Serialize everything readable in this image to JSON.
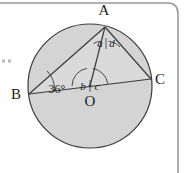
{
  "figure": {
    "colors": {
      "circle_fill": "#d4d4d4",
      "stroke": "#3a3a3a",
      "border": "#9a9a9a",
      "text": "#1a1a1a",
      "background": "#ffffff"
    },
    "circle": {
      "centre_label": "O",
      "cx": 90,
      "cy": 86,
      "r": 62
    },
    "vertices": [
      {
        "name": "vertex-a",
        "label": "A",
        "x": 105,
        "y": 27,
        "label_x": 104,
        "label_y": 15
      },
      {
        "name": "vertex-b",
        "label": "B",
        "x": 29,
        "y": 94,
        "label_x": 16,
        "label_y": 99
      },
      {
        "name": "vertex-c",
        "label": "C",
        "x": 151,
        "y": 79,
        "label_x": 158,
        "label_y": 84
      },
      {
        "name": "centre-o",
        "label": "O",
        "x": 90,
        "y": 86,
        "label_x": 90,
        "label_y": 103
      }
    ],
    "angles": [
      {
        "name": "angle-a",
        "label": "a",
        "x": 100,
        "y": 44,
        "at": "A"
      },
      {
        "name": "angle-d",
        "label": "d",
        "x": 112,
        "y": 44,
        "at": "A"
      },
      {
        "name": "angle-b",
        "label": "b",
        "x": 83,
        "y": 88,
        "at": "O"
      },
      {
        "name": "angle-c",
        "label": "c",
        "x": 97,
        "y": 88,
        "at": "O"
      },
      {
        "name": "angle-36",
        "label": "36°",
        "x": 57,
        "y": 90,
        "at": "B"
      }
    ],
    "segments": [
      {
        "name": "segment-ba",
        "from": "B",
        "to": "A"
      },
      {
        "name": "segment-ac",
        "from": "A",
        "to": "C"
      },
      {
        "name": "segment-bc",
        "from": "B",
        "to": "C"
      },
      {
        "name": "segment-ao",
        "from": "A",
        "to": "O"
      }
    ],
    "margin_dots": [
      {
        "name": "margin-dot-1",
        "x": 3,
        "y": 61
      },
      {
        "name": "margin-dot-2",
        "x": 9,
        "y": 61
      }
    ]
  }
}
